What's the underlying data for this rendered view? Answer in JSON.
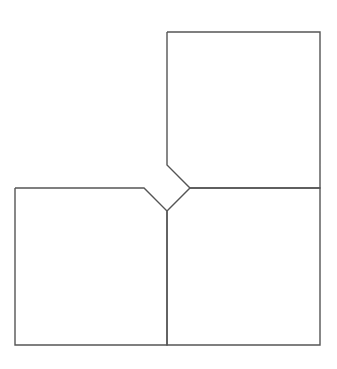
{
  "diagram": {
    "width": 337,
    "height": 369,
    "stroke_color": "#555555",
    "stroke_width": 1.4,
    "background": "#ffffff",
    "shapes": [
      {
        "name": "top-right-square",
        "points": "167,32 320,32 320,188 190,188 167,165 167,32"
      },
      {
        "name": "bottom-left-square",
        "points": "15,188 144,188 167,211 167,345 15,345 15,188"
      },
      {
        "name": "bottom-right-square",
        "points": "167,211 190,188 320,188 320,345 167,345 167,211"
      }
    ]
  }
}
